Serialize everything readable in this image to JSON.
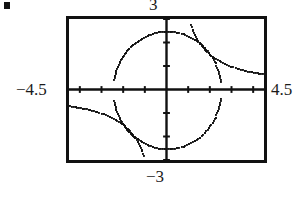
{
  "figure": {
    "kind": "graphing-calculator-viewport",
    "artifact_speck": " "
  },
  "labels": {
    "x_min": "−4.5",
    "x_max": "4.5",
    "y_max": "3",
    "y_min": "−3"
  },
  "colors": {
    "ink": "#111111",
    "curve": "#111111",
    "background": "#ffffff",
    "text": "#1b1b1b"
  },
  "chart_data": {
    "type": "line",
    "title": "",
    "xlabel": "",
    "ylabel": "",
    "xlim": [
      -4.5,
      4.5
    ],
    "ylim": [
      -3,
      3
    ],
    "xticks": [
      -4,
      -3,
      -2,
      -1,
      0,
      1,
      2,
      3,
      4
    ],
    "yticks": [
      -3,
      -2,
      -1,
      0,
      1,
      2,
      3
    ],
    "grid": false,
    "legend": null,
    "axes": {
      "x_axis_drawn": true,
      "y_axis_drawn": true,
      "tick_interval_x": 1,
      "tick_interval_y": 1,
      "frame": true
    },
    "series": [
      {
        "name": "circle-upper",
        "equation": "y = sqrt(6.25 - x^2)",
        "style": "dotted-pixelated",
        "points": [
          [
            -2.46,
            0.43
          ],
          [
            -2.42,
            0.62
          ],
          [
            -2.36,
            0.83
          ],
          [
            -2.28,
            1.02
          ],
          [
            -2.18,
            1.22
          ],
          [
            -2.06,
            1.41
          ],
          [
            -1.92,
            1.6
          ],
          [
            -1.76,
            1.78
          ],
          [
            -1.58,
            1.94
          ],
          [
            -1.38,
            2.08
          ],
          [
            -1.16,
            2.21
          ],
          [
            -0.92,
            2.32
          ],
          [
            -0.66,
            2.41
          ],
          [
            -0.38,
            2.47
          ],
          [
            -0.1,
            2.5
          ],
          [
            0.18,
            2.49
          ],
          [
            0.46,
            2.46
          ],
          [
            0.74,
            2.39
          ],
          [
            1.0,
            2.29
          ],
          [
            1.26,
            2.16
          ],
          [
            1.5,
            2.0
          ],
          [
            1.72,
            1.81
          ],
          [
            1.92,
            1.6
          ],
          [
            2.08,
            1.39
          ],
          [
            2.22,
            1.15
          ],
          [
            2.34,
            0.88
          ],
          [
            2.42,
            0.62
          ],
          [
            2.47,
            0.38
          ]
        ]
      },
      {
        "name": "circle-lower",
        "equation": "y = -sqrt(6.25 - x^2)",
        "style": "dotted-pixelated",
        "points": [
          [
            -2.46,
            -0.43
          ],
          [
            -2.42,
            -0.62
          ],
          [
            -2.36,
            -0.83
          ],
          [
            -2.28,
            -1.02
          ],
          [
            -2.18,
            -1.22
          ],
          [
            -2.06,
            -1.41
          ],
          [
            -1.92,
            -1.6
          ],
          [
            -1.76,
            -1.78
          ],
          [
            -1.58,
            -1.94
          ],
          [
            -1.38,
            -2.08
          ],
          [
            -1.16,
            -2.21
          ],
          [
            -0.92,
            -2.32
          ],
          [
            -0.66,
            -2.41
          ],
          [
            -0.38,
            -2.47
          ],
          [
            -0.1,
            -2.5
          ],
          [
            0.18,
            -2.49
          ],
          [
            0.46,
            -2.46
          ],
          [
            0.74,
            -2.39
          ],
          [
            1.0,
            -2.29
          ],
          [
            1.26,
            -2.16
          ],
          [
            1.5,
            -2.0
          ],
          [
            1.72,
            -1.81
          ],
          [
            1.92,
            -1.6
          ],
          [
            2.08,
            -1.39
          ],
          [
            2.22,
            -1.15
          ],
          [
            2.34,
            -0.88
          ],
          [
            2.42,
            -0.62
          ],
          [
            2.47,
            -0.38
          ]
        ]
      },
      {
        "name": "hyperbola-branch-I",
        "equation": "y = 3 / x",
        "style": "dotted-pixelated",
        "points": [
          [
            1.08,
            2.78
          ],
          [
            1.16,
            2.59
          ],
          [
            1.26,
            2.38
          ],
          [
            1.36,
            2.21
          ],
          [
            1.48,
            2.03
          ],
          [
            1.62,
            1.85
          ],
          [
            1.78,
            1.69
          ],
          [
            1.96,
            1.53
          ],
          [
            2.16,
            1.39
          ],
          [
            2.4,
            1.25
          ],
          [
            2.66,
            1.13
          ],
          [
            2.94,
            1.02
          ],
          [
            3.24,
            0.93
          ],
          [
            3.56,
            0.84
          ],
          [
            3.9,
            0.77
          ],
          [
            4.24,
            0.71
          ],
          [
            4.5,
            0.67
          ]
        ]
      },
      {
        "name": "hyperbola-branch-III",
        "equation": "y = 3 / x",
        "style": "dotted-pixelated",
        "points": [
          [
            -1.08,
            -2.78
          ],
          [
            -1.16,
            -2.59
          ],
          [
            -1.26,
            -2.38
          ],
          [
            -1.36,
            -2.21
          ],
          [
            -1.48,
            -2.03
          ],
          [
            -1.62,
            -1.85
          ],
          [
            -1.78,
            -1.69
          ],
          [
            -1.96,
            -1.53
          ],
          [
            -2.16,
            -1.39
          ],
          [
            -2.4,
            -1.25
          ],
          [
            -2.66,
            -1.13
          ],
          [
            -2.94,
            -1.02
          ],
          [
            -3.24,
            -0.93
          ],
          [
            -3.56,
            -0.84
          ],
          [
            -3.9,
            -0.77
          ],
          [
            -4.24,
            -0.71
          ],
          [
            -4.5,
            -0.67
          ]
        ]
      }
    ],
    "annotations": [
      {
        "text": "3",
        "position": "top-of-frame",
        "role": "y-window-max"
      },
      {
        "text": "−3",
        "position": "bottom-of-frame",
        "role": "y-window-min"
      },
      {
        "text": "−4.5",
        "position": "left-of-frame",
        "role": "x-window-min"
      },
      {
        "text": "4.5",
        "position": "right-of-frame",
        "role": "x-window-max"
      }
    ]
  }
}
